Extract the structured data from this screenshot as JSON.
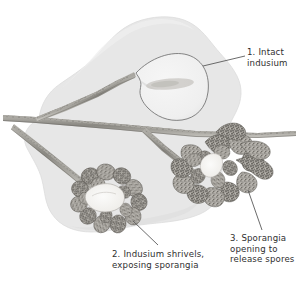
{
  "figure": {
    "background_color": "#ffffff",
    "lamina_color": "#e6e6e6",
    "lamina_edge_color": "#d2d2d2",
    "vein_color": "#8c8a84",
    "vein_dark_color": "#5d5b56",
    "indusium_fill": "#f2f2f2",
    "indusium_outline": "#6f6f6f",
    "sporangia_dark": "#6b6864",
    "sporangia_mid": "#9b9893",
    "sporangia_light": "#cfccc6",
    "leader_line_color": "#5a5a5a",
    "text_color": "#2f2f2f"
  },
  "labels": [
    {
      "id": "label-1",
      "number": "1.",
      "text": "1. Intact\nindusium",
      "describes": "intact-indusium"
    },
    {
      "id": "label-2",
      "number": "2.",
      "text": "2. Indusium shrivels,\nexposing sporangia",
      "describes": "shriveled-indusium-sporangia"
    },
    {
      "id": "label-3",
      "number": "3.",
      "text": "3. Sporangia\nopening to\nrelease spores",
      "describes": "sporangia-releasing-spores"
    }
  ],
  "parts": {
    "intact_indusium": "intact indusium",
    "shriveled_indusium": "shriveled indusium exposing sporangia",
    "open_sporangia": "sporangia opening to release spores",
    "vein": "frond vein",
    "lamina": "frond blade"
  }
}
